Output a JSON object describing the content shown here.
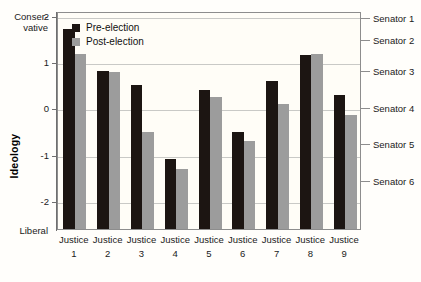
{
  "chart_data": {
    "type": "bar",
    "title": "",
    "xlabel": "",
    "ylabel": "Ideology",
    "ylim": [
      -2.6,
      2.1
    ],
    "grid": true,
    "legend_position": "top-left-inside",
    "categories": [
      "Justice 1",
      "Justice 2",
      "Justice 3",
      "Justice 4",
      "Justice 5",
      "Justice 6",
      "Justice 7",
      "Justice 8",
      "Justice 9"
    ],
    "categories_line1": [
      "Justice",
      "Justice",
      "Justice",
      "Justice",
      "Justice",
      "Justice",
      "Justice",
      "Justice",
      "Justice"
    ],
    "categories_line2": [
      "1",
      "2",
      "3",
      "4",
      "5",
      "6",
      "7",
      "8",
      "9"
    ],
    "series": [
      {
        "name": "Pre-election",
        "color": "#1c1512",
        "values": [
          1.72,
          0.8,
          0.5,
          -1.1,
          0.4,
          -0.5,
          0.6,
          1.15,
          0.3
        ]
      },
      {
        "name": "Post-election",
        "color": "#9c9c9c",
        "values": [
          1.18,
          0.78,
          -0.5,
          -1.3,
          0.25,
          -0.7,
          0.1,
          1.18,
          -0.15
        ]
      }
    ],
    "yticks": [
      2,
      1,
      0,
      -1,
      -2
    ],
    "ytick_labels": [
      "2",
      "1",
      "0",
      "-1",
      "-2"
    ],
    "y_axis_high_label": "Conser-\nvative",
    "y_axis_high_label_line1": "Conser-",
    "y_axis_high_label_line2": "vative",
    "y_axis_low_label": "Liberal",
    "annotations": [
      {
        "label": "Senator 1",
        "value": 1.95
      },
      {
        "label": "Senator 2",
        "value": 1.48
      },
      {
        "label": "Senator 3",
        "value": 0.8
      },
      {
        "label": "Senator 4",
        "value": 0.0
      },
      {
        "label": "Senator 5",
        "value": -0.76
      },
      {
        "label": "Senator 6",
        "value": -1.56
      }
    ]
  }
}
